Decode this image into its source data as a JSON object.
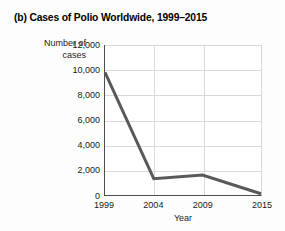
{
  "figure": {
    "label": "(b)",
    "background_color": "#fdfdfd",
    "plot_background_color": "#ffffff"
  },
  "chart_data": {
    "type": "line",
    "title": "(b) Cases of Polio Worldwide, 1999–2015",
    "xlabel": "Year",
    "ylabel": "Number of cases",
    "ylabel_line1": "Number of",
    "ylabel_line2": "cases",
    "categories": [
      "1999",
      "2004",
      "2009",
      "2015"
    ],
    "x": [
      1999,
      2004,
      2009,
      2015
    ],
    "values": [
      9800,
      1300,
      1600,
      100
    ],
    "series": [
      {
        "name": "Cases of polio worldwide",
        "values": [
          9800,
          1300,
          1600,
          100
        ],
        "color": "#595959",
        "line_width": 3
      }
    ],
    "xlim": [
      1999,
      2015
    ],
    "ylim": [
      0,
      12000
    ],
    "yticks": [
      0,
      2000,
      4000,
      6000,
      8000,
      10000,
      12000
    ],
    "ytick_labels": [
      "0",
      "2,000",
      "4,000",
      "6,000",
      "8,000",
      "10,000",
      "12,000"
    ],
    "xticks": [
      1999,
      2004,
      2009,
      2015
    ],
    "xtick_labels": [
      "1999",
      "2004",
      "2009",
      "2015"
    ],
    "grid": {
      "horizontal": true,
      "vertical": true,
      "vertical_at": [
        2004,
        2009
      ],
      "color": "#d9d9d9"
    },
    "legend": null,
    "legend_position": "none",
    "annotations": []
  }
}
